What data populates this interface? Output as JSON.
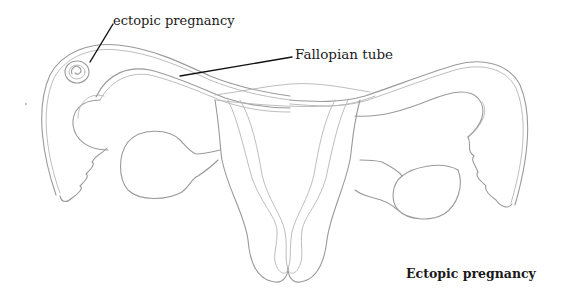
{
  "diagram": {
    "title": "Ectopic pregnancy",
    "labels": {
      "ectopic_pregnancy": "ectopic pregnancy",
      "fallopian_tube": "Fallopian tube"
    },
    "caption": "Ectopic pregnancy",
    "colors": {
      "background": "#ffffff",
      "line_art": "#9a9a9a",
      "leader_line": "#111111",
      "text": "#1a1a1a"
    }
  }
}
